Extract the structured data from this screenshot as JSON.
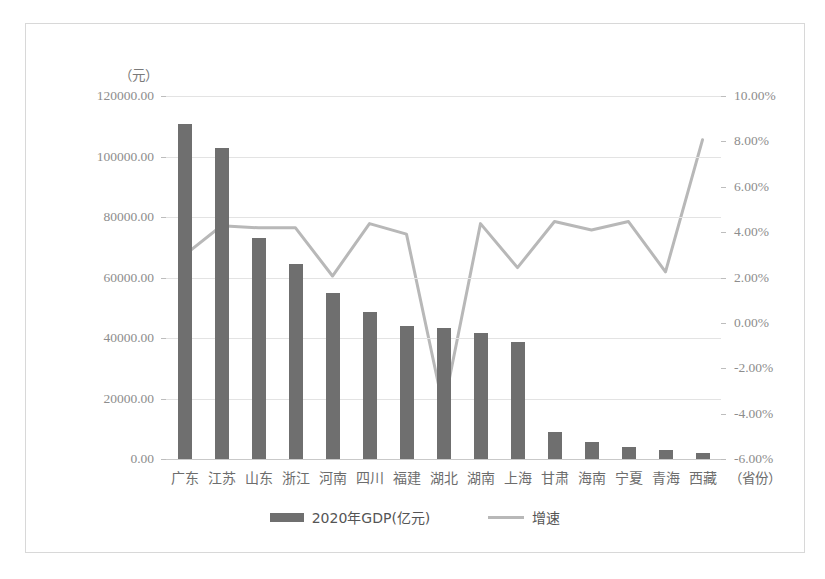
{
  "chart_data": {
    "type": "bar",
    "title": "",
    "subtitle": "",
    "unit_label": "（元）",
    "xlabel": "（省份）",
    "ylabel": "",
    "categories": [
      "广东",
      "江苏",
      "山东",
      "浙江",
      "河南",
      "四川",
      "福建",
      "湖北",
      "湖南",
      "上海",
      "甘肃",
      "海南",
      "宁夏",
      "青海",
      "西藏"
    ],
    "grid": true,
    "legend_position": "bottom",
    "axes": {
      "left": {
        "label": "（元）",
        "min": 0,
        "max": 120000,
        "step": 20000,
        "ticks": [
          "0.00",
          "20000.00",
          "40000.00",
          "60000.00",
          "80000.00",
          "100000.00",
          "120000.00"
        ],
        "tick_values": [
          0,
          20000,
          40000,
          60000,
          80000,
          100000,
          120000
        ]
      },
      "right": {
        "label": "",
        "min": -6,
        "max": 10,
        "step": 2,
        "ticks": [
          "-6.00%",
          "-4.00%",
          "-2.00%",
          "0.00%",
          "2.00%",
          "4.00%",
          "6.00%",
          "8.00%",
          "10.00%"
        ],
        "tick_values": [
          -6,
          -4,
          -2,
          0,
          2,
          4,
          6,
          8,
          10
        ]
      }
    },
    "series": [
      {
        "name": "2020年GDP(亿元)",
        "type": "bar",
        "axis": "left",
        "color": "#6f6f6f",
        "values": [
          110760,
          102720,
          73130,
          64610,
          54990,
          48600,
          43900,
          43440,
          41780,
          38700,
          9020,
          5530,
          3920,
          3010,
          1900
        ]
      },
      {
        "name": "增速",
        "type": "line",
        "axis": "right",
        "color": "#b8b8b8",
        "values": [
          2.3,
          3.7,
          3.6,
          3.6,
          1.3,
          3.8,
          3.3,
          -5.0,
          3.8,
          1.7,
          3.9,
          3.5,
          3.9,
          1.5,
          7.8
        ]
      }
    ]
  },
  "legend": {
    "entries": [
      {
        "label": "2020年GDP(亿元)",
        "swatch": "bar-swatch",
        "color": "#6f6f6f"
      },
      {
        "label": "增速",
        "swatch": "line-swatch",
        "color": "#b8b8b8"
      }
    ]
  }
}
